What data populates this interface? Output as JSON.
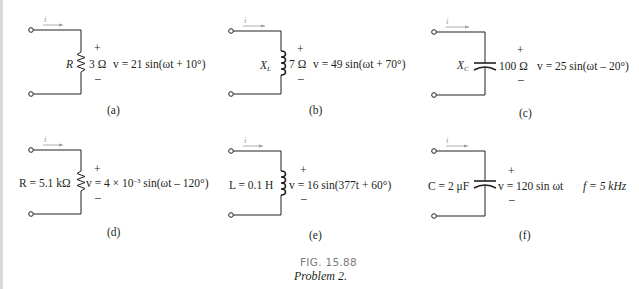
{
  "figure": {
    "number": "FIG. 15.88",
    "caption": "Problem 2."
  },
  "circuits": [
    {
      "label": "(a)",
      "current": "i",
      "element_symbol": "R",
      "element_value": "3 Ω",
      "plus": "+",
      "minus": "–",
      "equation": "v = 21 sin(ωt + 10°)"
    },
    {
      "label": "(b)",
      "current": "i",
      "element_symbol": "X",
      "element_sub": "L",
      "element_value": "7 Ω",
      "plus": "+",
      "minus": "–",
      "equation": "v = 49 sin(ωt + 70°)"
    },
    {
      "label": "(c)",
      "current": "i",
      "element_symbol": "X",
      "element_sub": "C",
      "element_value": "100 Ω",
      "plus": "+",
      "minus": "–",
      "equation": "v = 25 sin(ωt – 20°)"
    },
    {
      "label": "(d)",
      "current": "i",
      "element_text": "R = 5.1 kΩ",
      "plus": "+",
      "minus": "–",
      "eq_pre": "v = 4 × 10",
      "eq_exp": "–3",
      "eq_post": " sin(ωt – 120°)"
    },
    {
      "label": "(e)",
      "current": "i",
      "element_text": "L = 0.1 H",
      "plus": "+",
      "minus": "–",
      "equation": "v = 16 sin(377t + 60°)"
    },
    {
      "label": "(f)",
      "current": "i",
      "element_text": "C = 2 μF",
      "plus": "+",
      "minus": "–",
      "equation": "v = 120 sin ωt",
      "extra": "f = 5 kHz"
    }
  ]
}
